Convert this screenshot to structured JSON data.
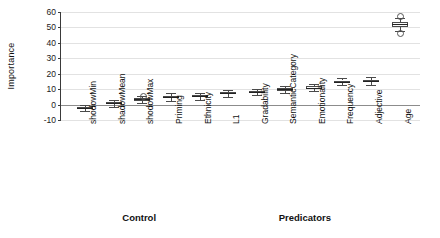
{
  "chart_data": {
    "type": "box",
    "title": "",
    "xlabel": "",
    "ylabel": "Importance",
    "ylim": [
      -10,
      60
    ],
    "yticks": [
      -10,
      0,
      10,
      20,
      30,
      40,
      50,
      60
    ],
    "grid": true,
    "legend": false,
    "group_labels": [
      "Control",
      "Predicators"
    ],
    "categories": [
      "shodowMin",
      "shadowMean",
      "shodowMax",
      "Priming",
      "Ethnicity",
      "L1",
      "Gradability",
      "SemanticCategory",
      "Emotionality",
      "Frequency",
      "Adjective",
      "Age"
    ],
    "boxes": [
      {
        "category": "shodowMin",
        "group": "Control",
        "min": -4.0,
        "q1": -2.6,
        "median": -2.0,
        "q3": -1.4,
        "max": 0.0,
        "outliers": []
      },
      {
        "category": "shadowMean",
        "group": "Control",
        "min": -1.5,
        "q1": 0.2,
        "median": 0.8,
        "q3": 1.5,
        "max": 2.8,
        "outliers": []
      },
      {
        "category": "shodowMax",
        "group": "Control",
        "min": 1.2,
        "q1": 2.6,
        "median": 3.3,
        "q3": 4.0,
        "max": 5.4,
        "outliers": [
          6.2
        ]
      },
      {
        "category": "Priming",
        "group": "Control",
        "min": 2.6,
        "q1": 4.0,
        "median": 4.8,
        "q3": 5.6,
        "max": 7.2,
        "outliers": []
      },
      {
        "category": "Ethnicity",
        "group": "Predicators",
        "min": 3.2,
        "q1": 4.6,
        "median": 5.4,
        "q3": 6.2,
        "max": 7.8,
        "outliers": []
      },
      {
        "category": "L1",
        "group": "Predicators",
        "min": 5.2,
        "q1": 6.6,
        "median": 7.3,
        "q3": 8.1,
        "max": 9.4,
        "outliers": []
      },
      {
        "category": "Gradability",
        "group": "Predicators",
        "min": 6.0,
        "q1": 7.4,
        "median": 8.0,
        "q3": 8.8,
        "max": 10.2,
        "outliers": []
      },
      {
        "category": "SemanticCategory",
        "group": "Predicators",
        "min": 7.4,
        "q1": 9.0,
        "median": 9.8,
        "q3": 10.6,
        "max": 12.2,
        "outliers": []
      },
      {
        "category": "Emotionality",
        "group": "Predicators",
        "min": 8.6,
        "q1": 10.2,
        "median": 11.0,
        "q3": 11.8,
        "max": 13.4,
        "outliers": []
      },
      {
        "category": "Frequency",
        "group": "Predicators",
        "min": 12.4,
        "q1": 14.0,
        "median": 14.8,
        "q3": 15.6,
        "max": 17.2,
        "outliers": []
      },
      {
        "category": "Adjective",
        "group": "Predicators",
        "min": 12.8,
        "q1": 14.4,
        "median": 15.2,
        "q3": 16.0,
        "max": 17.6,
        "outliers": []
      },
      {
        "category": "Age",
        "group": "Predicators",
        "min": 48.0,
        "q1": 50.5,
        "median": 52.0,
        "q3": 53.5,
        "max": 56.0,
        "outliers": [
          57.5,
          46.5
        ]
      }
    ]
  },
  "axis": {
    "ylabel": "Importance",
    "yticks": [
      "60",
      "50",
      "40",
      "30",
      "20",
      "10",
      "0",
      "-10"
    ]
  },
  "groups": [
    {
      "label": "Control",
      "center_pct": 22
    },
    {
      "label": "Predicators",
      "center_pct": 68
    }
  ]
}
